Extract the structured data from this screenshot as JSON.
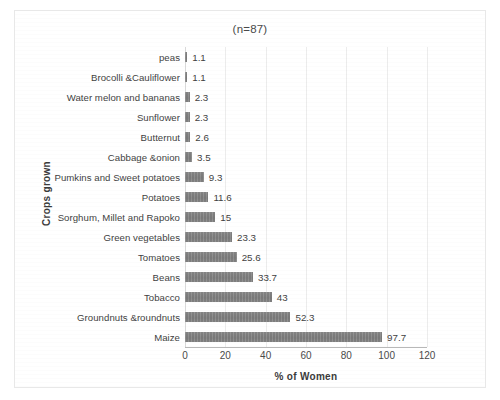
{
  "chart_data": {
    "type": "bar",
    "orientation": "horizontal",
    "title": "(n=87)",
    "xlabel": "% of Women",
    "ylabel": "Crops grown",
    "xlim": [
      0,
      120
    ],
    "xticks": [
      0,
      20,
      40,
      60,
      80,
      100,
      120
    ],
    "xtick_labels": [
      "0",
      "20",
      "40",
      "60",
      "80",
      "100",
      "120"
    ],
    "grid": true,
    "grid_axis": "x",
    "legend": false,
    "bar_color": "#808080",
    "categories": [
      "peas",
      "Brocolli &Cauliflower",
      "Water melon and bananas",
      "Sunflower",
      "Butternut",
      "Cabbage &onion",
      "Pumkins and Sweet potatoes",
      "Potatoes",
      "Sorghum, Millet and Rapoko",
      "Green vegetables",
      "Tomatoes",
      "Beans",
      "Tobacco",
      "Groundnuts &roundnuts",
      "Maize"
    ],
    "values": [
      1.1,
      1.1,
      2.3,
      2.3,
      2.6,
      3.5,
      9.3,
      11.6,
      15,
      23.3,
      25.6,
      33.7,
      43,
      52.3,
      97.7
    ],
    "value_labels": [
      "1.1",
      "1.1",
      "2.3",
      "2.3",
      "2.6",
      "3.5",
      "9.3",
      "11.6",
      "15",
      "23.3",
      "25.6",
      "33.7",
      "43",
      "52.3",
      "97.7"
    ]
  }
}
